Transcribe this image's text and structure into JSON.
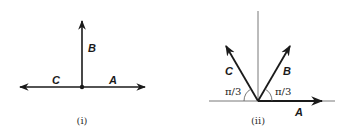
{
  "figures": [
    {
      "id": "i",
      "caption": "(i)",
      "vectors": [
        {
          "name": "A",
          "label": "A",
          "direction": "right"
        },
        {
          "name": "B",
          "label": "B",
          "direction": "up"
        },
        {
          "name": "C",
          "label": "C",
          "direction": "left"
        }
      ]
    },
    {
      "id": "ii",
      "caption": "(ii)",
      "vectors": [
        {
          "name": "A",
          "label": "A",
          "direction": "right"
        },
        {
          "name": "B",
          "label": "B",
          "angle_from_horizontal": "π/3"
        },
        {
          "name": "C",
          "label": "C",
          "angle_from_horizontal": "π/3"
        }
      ],
      "angle_labels": [
        "π/3",
        "π/3"
      ]
    }
  ],
  "colors": {
    "ink": "#1a1a1a",
    "thin_line": "#555555"
  }
}
